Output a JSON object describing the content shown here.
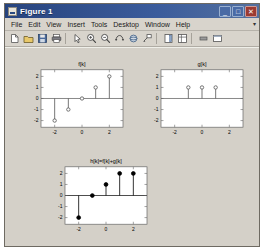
{
  "window": {
    "title": "Figure 1",
    "icon": "figure-icon",
    "buttons": [
      {
        "name": "minimize-button",
        "glyph": "_"
      },
      {
        "name": "maximize-button",
        "glyph": "□"
      },
      {
        "name": "close-button",
        "glyph": "✕"
      }
    ]
  },
  "menubar": {
    "items": [
      "File",
      "Edit",
      "View",
      "Insert",
      "Tools",
      "Desktop",
      "Window",
      "Help"
    ],
    "overflow_glyph": "▾"
  },
  "toolbar": {
    "buttons": [
      "new-figure-icon",
      "open-file-icon",
      "save-figure-icon",
      "print-figure-icon",
      "separator",
      "pointer-icon",
      "zoom-in-icon",
      "zoom-out-icon",
      "pan-icon",
      "rotate-3d-icon",
      "data-cursor-icon",
      "separator",
      "insert-colorbar-icon",
      "insert-legend-icon",
      "separator",
      "hide-plot-tools-icon",
      "show-plot-tools-icon"
    ]
  },
  "chart_data": [
    {
      "type": "stem",
      "name": "f-subplot",
      "title": "f[k]",
      "xlabel": "",
      "ylabel": "",
      "x": [
        -2,
        -1,
        0,
        1,
        2
      ],
      "values": [
        -2,
        -1,
        0,
        1,
        2
      ],
      "xlim": [
        -3,
        3
      ],
      "ylim": [
        -2.6,
        2.6
      ],
      "xticks": [
        -2,
        0,
        2
      ],
      "xticklabels": [
        "-2",
        "0",
        "2"
      ],
      "yticks": [
        -2,
        -1,
        0,
        1,
        2
      ],
      "yticklabels": [
        "-2",
        "-1",
        "0",
        "1",
        "2"
      ],
      "marker": "open-circle",
      "grid": false,
      "color": "#555555"
    },
    {
      "type": "stem",
      "name": "g-subplot",
      "title": "g[k]",
      "xlabel": "",
      "ylabel": "",
      "x": [
        -1,
        0,
        1
      ],
      "values": [
        1,
        1,
        1
      ],
      "xlim": [
        -3,
        3
      ],
      "ylim": [
        -2.6,
        2.6
      ],
      "xticks": [
        -2,
        0,
        2
      ],
      "xticklabels": [
        "-2",
        "0",
        "2"
      ],
      "yticks": [
        -2,
        -1,
        0,
        1,
        2
      ],
      "yticklabels": [
        "-2",
        "-1",
        "0",
        "1",
        "2"
      ],
      "marker": "open-circle",
      "grid": false,
      "color": "#555555"
    },
    {
      "type": "stem",
      "name": "h-subplot",
      "title": "h[k]=f[k]+g[k]",
      "xlabel": "",
      "ylabel": "",
      "x": [
        -2,
        -1,
        0,
        1,
        2
      ],
      "values": [
        -2,
        0,
        1,
        2,
        2
      ],
      "xlim": [
        -3,
        3
      ],
      "ylim": [
        -2.6,
        2.6
      ],
      "xticks": [
        -2,
        0,
        2
      ],
      "xticklabels": [
        "-2",
        "0",
        "2"
      ],
      "yticks": [
        -2,
        -1,
        0,
        1,
        2
      ],
      "yticklabels": [
        "-2",
        "-1",
        "0",
        "1",
        "2"
      ],
      "marker": "filled-circle",
      "grid": false,
      "color": "#000000"
    }
  ]
}
